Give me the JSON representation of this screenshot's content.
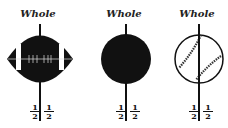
{
  "panels": [
    {
      "id": "football",
      "title": "Whole",
      "left_half": {
        "num": "1",
        "den": "2"
      },
      "right_half": {
        "num": "1",
        "den": "2"
      }
    },
    {
      "id": "solid-ball",
      "title": "Whole",
      "left_half": {
        "num": "1",
        "den": "2"
      },
      "right_half": {
        "num": "1",
        "den": "2"
      }
    },
    {
      "id": "baseball",
      "title": "Whole",
      "left_half": {
        "num": "1",
        "den": "2"
      },
      "right_half": {
        "num": "1",
        "den": "2"
      }
    }
  ],
  "colors": {
    "ink": "#111111",
    "background": "#ffffff"
  }
}
